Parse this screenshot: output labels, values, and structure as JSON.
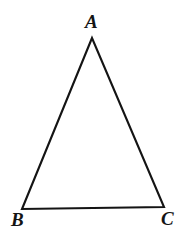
{
  "figure": {
    "kind": "geometry-diagram",
    "shape": "triangle",
    "background_color": "#ffffff",
    "stroke_color": "#141414",
    "stroke_width": 2.1
  },
  "labels": {
    "apex": "A",
    "bottom_left": "B",
    "bottom_right": "C"
  },
  "chart_data": {
    "type": "scatter",
    "title": "",
    "xlabel": "",
    "ylabel": "",
    "grid": false,
    "legend": "none",
    "xlim": [
      0,
      190
    ],
    "ylim": [
      245,
      0
    ],
    "annotations": [
      "A",
      "B",
      "C"
    ],
    "points": [
      {
        "label": "A",
        "x": 92,
        "y": 38
      },
      {
        "label": "B",
        "x": 22,
        "y": 209
      },
      {
        "label": "C",
        "x": 164,
        "y": 207
      }
    ],
    "edges": [
      {
        "name": "AB",
        "from": "A",
        "to": "B"
      },
      {
        "name": "BC",
        "from": "B",
        "to": "C"
      },
      {
        "name": "CA",
        "from": "C",
        "to": "A"
      }
    ]
  }
}
